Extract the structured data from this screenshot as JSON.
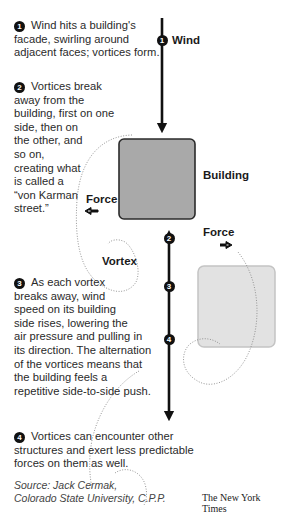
{
  "steps": [
    {
      "number": "1",
      "text": "Wind hits a building's facade, swirling around adjacent faces; vortices form."
    },
    {
      "number": "2",
      "text": "Vortices break away from the building, first on one side, then on the other, and so on, creating what is called a “von Karman street.”"
    },
    {
      "number": "3",
      "text": "As each vortex breaks away, wind speed on its building side rises, lowering the air pressure and pulling in its direction. The alternation of the vortices means that the building feels a repetitive side-to-side push."
    },
    {
      "number": "4",
      "text": "Vortices can encounter other structures and exert less predictable forces on them as well."
    }
  ],
  "step_lines": {
    "s1": [
      "Wind hits a building's",
      "facade, swirling around",
      "adjacent faces; vortices form."
    ],
    "s2": [
      "Vortices break",
      "away from the",
      "building, first on one",
      "side, then on",
      "the other, and",
      "so on,",
      "creating what",
      "is called a",
      "“von Karman",
      "street.”"
    ],
    "s3": [
      "As each vortex",
      "breaks away, wind",
      "speed on its building",
      "side rises, lowering the",
      "air pressure and pulling in",
      "its direction. The alternation",
      "of the vortices means that",
      "the building feels a",
      "repetitive side-to-side push."
    ],
    "s4": [
      "Vortices can encounter other",
      "structures and exert less predictable",
      "forces on them as well."
    ]
  },
  "diagram": {
    "wind_label": "Wind",
    "building_label": "Building",
    "force_label_left": "Force",
    "force_label_right": "Force",
    "vortex_label": "Vortex",
    "markers": [
      "1",
      "2",
      "3",
      "4"
    ],
    "colors": {
      "building_fill": "#a9a9a9",
      "building_stroke": "#2b2b2b",
      "ghost_building_fill": "#e2e2e2",
      "ghost_building_stroke": "#c4c4c4",
      "arrow": "#111111",
      "dotted": "#8a8a8a"
    }
  },
  "source": {
    "line1": "Source: Jack Cermak,",
    "line2": "Colorado State University, C.P.P."
  },
  "credit": "The New York Times"
}
